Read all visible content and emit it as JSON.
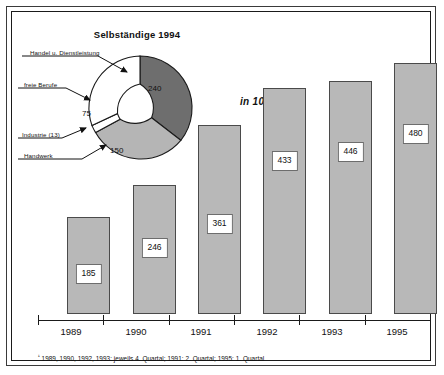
{
  "figure": {
    "units_note": "in 1000",
    "footnote_marker": "¹",
    "footnote": "1989, 1990, 1992, 1993: jeweils 4. Quartal; 1991: 2. Quartal; 1995: 1. Quartal"
  },
  "donut": {
    "title": "Selbständige 1994",
    "segments": [
      {
        "label": "Handel u. Dienstleistung",
        "value": "240",
        "color": "#6e6e6e"
      },
      {
        "label": "freie Berufe",
        "value": "75",
        "color": "#ffffff"
      },
      {
        "label": "Industrie (13)",
        "value": "13",
        "color": "#ffffff"
      },
      {
        "label": "Handwerk",
        "value": "150",
        "color": "#b5b5b5"
      }
    ]
  },
  "chart_data": {
    "type": "bar",
    "title": "Selbständige",
    "xlabel": "",
    "ylabel": "in 1000",
    "categories": [
      "1989",
      "1990",
      "1991",
      "1992",
      "1993",
      "1995"
    ],
    "values": [
      185,
      246,
      361,
      433,
      446,
      480
    ],
    "value_labels": [
      "185",
      "246",
      "361",
      "433",
      "446",
      "480"
    ],
    "ylim": [
      0,
      520
    ],
    "grid": false,
    "legend": null,
    "bar_color": "#b8b8b8",
    "bar_border": "#4a4a4a",
    "annotations": [
      "in 1000"
    ]
  }
}
